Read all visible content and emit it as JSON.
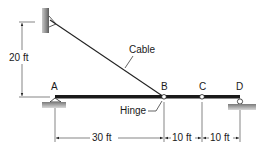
{
  "diagram": {
    "labels": {
      "cable": "Cable",
      "hinge": "Hinge",
      "point_a": "A",
      "point_b": "B",
      "point_c": "C",
      "point_d": "D"
    },
    "dimensions": {
      "vertical": "20 ft",
      "ab": "30 ft",
      "bc": "10 ft",
      "cd": "10 ft"
    },
    "colors": {
      "beam": "#1a1a1a",
      "line": "#222222",
      "ground": "#9a9a9a",
      "wall": "#8c8c8c"
    }
  }
}
